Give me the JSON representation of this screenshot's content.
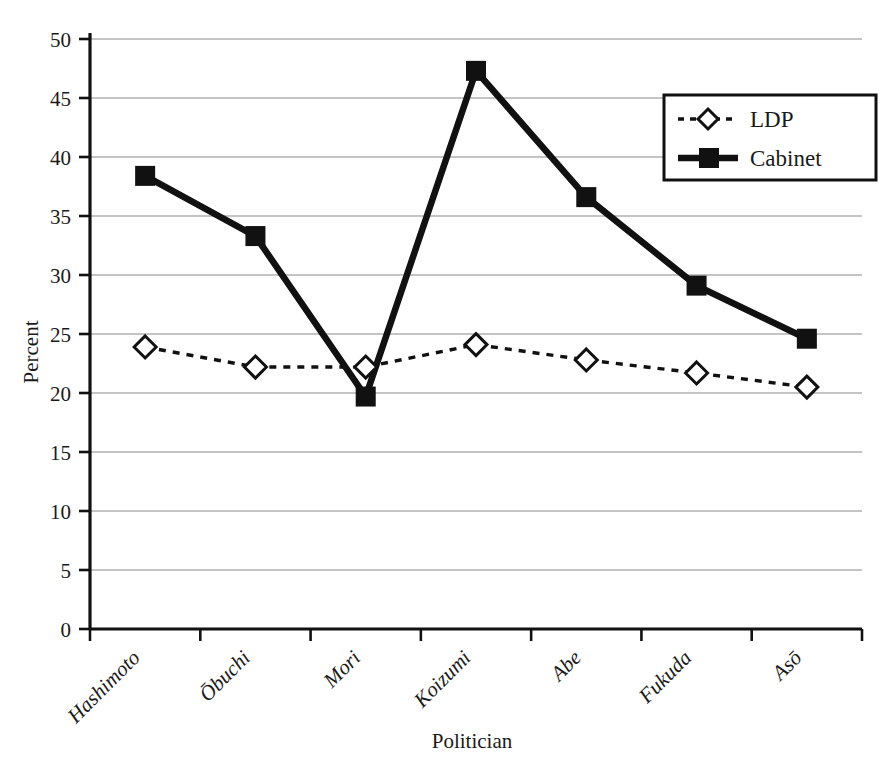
{
  "chart_data": {
    "type": "line",
    "title": "",
    "xlabel": "Politician",
    "ylabel": "Percent",
    "categories": [
      "Hashimoto",
      "Ōbuchi",
      "Mori",
      "Koizumi",
      "Abe",
      "Fukuda",
      "Asō"
    ],
    "series": [
      {
        "name": "LDP",
        "marker": "diamond-open",
        "line": "dashed",
        "color": "#111111",
        "values": [
          23.9,
          22.2,
          22.2,
          24.1,
          22.8,
          21.7,
          20.5
        ]
      },
      {
        "name": "Cabinet",
        "marker": "square-filled",
        "line": "solid",
        "color": "#111111",
        "values": [
          38.4,
          33.3,
          19.7,
          47.3,
          36.6,
          29.1,
          24.6
        ]
      }
    ],
    "ylim": [
      0,
      50
    ],
    "ytick_step": 5,
    "yticks": [
      "0",
      "5",
      "10",
      "15",
      "20",
      "25",
      "30",
      "35",
      "40",
      "45",
      "50"
    ],
    "grid": true,
    "grid_color": "#b0b0b0",
    "legend_position": "upper-right",
    "axis_color": "#111111",
    "background": "#ffffff"
  },
  "legend": {
    "items": [
      {
        "label": "LDP"
      },
      {
        "label": "Cabinet"
      }
    ]
  }
}
